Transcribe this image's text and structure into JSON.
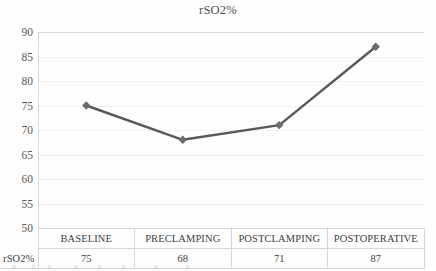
{
  "chart_data": {
    "type": "line",
    "title": "rSO2%",
    "xlabel": "",
    "ylabel": "",
    "categories": [
      "BASELINE",
      "PRECLAMPING",
      "POSTCLAMPING",
      "POSTOPERATIVE"
    ],
    "values": [
      75,
      68,
      71,
      87
    ],
    "series": [
      {
        "name": "rSO2%",
        "values": [
          75,
          68,
          71,
          87
        ]
      }
    ],
    "ylim": [
      50,
      90
    ],
    "yticks": [
      50,
      55,
      60,
      65,
      70,
      75,
      80,
      85,
      90
    ],
    "ytick_labels": [
      "50",
      "55",
      "60",
      "65",
      "70",
      "75",
      "80",
      "85",
      "90"
    ],
    "grid": true,
    "legend": false,
    "marker": "diamond",
    "line_color": "#595959",
    "marker_color": "#6b6b6b",
    "gridline_color": "#f0f0f0",
    "axis_color": "#d9d9d9"
  },
  "table": {
    "row_label": "rSO2%",
    "headers": [
      "BASELINE",
      "PRECLAMPING",
      "POSTCLAMPING",
      "POSTOPERATIVE"
    ],
    "values": [
      "75",
      "68",
      "71",
      "87"
    ],
    "border_color": "#d6d6d6"
  }
}
